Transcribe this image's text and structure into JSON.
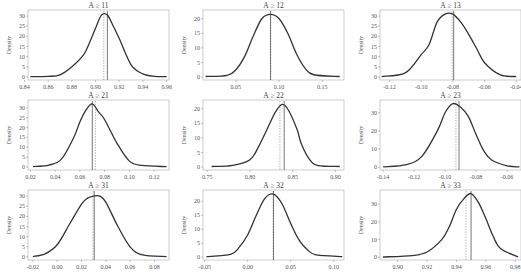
{
  "chart_data": [
    {
      "type": "line",
      "title": "A ≥ 11",
      "ylabel": "Density",
      "xlim": [
        0.843,
        0.962
      ],
      "ylim": [
        -1.5,
        33
      ],
      "xticks": [
        0.84,
        0.86,
        0.88,
        0.9,
        0.92,
        0.94,
        0.96
      ],
      "xtick_labels": [
        "0.84",
        "0.86",
        "0.88",
        "0.90",
        "0.92",
        "0.94",
        "0.96"
      ],
      "yticks": [
        0,
        5,
        10,
        15,
        20,
        25,
        30
      ],
      "ytick_labels": [
        "0",
        "5",
        "10",
        "15",
        "20",
        "25",
        "30"
      ],
      "x": [
        0.845,
        0.86,
        0.87,
        0.88,
        0.89,
        0.895,
        0.9,
        0.905,
        0.91,
        0.915,
        0.92,
        0.93,
        0.94,
        0.95,
        0.96
      ],
      "y": [
        0.2,
        0.3,
        1,
        5,
        11,
        17,
        24,
        30.5,
        30.5,
        25,
        19,
        6,
        1.5,
        0.3,
        0.2
      ],
      "solid_line": 0.91,
      "dashed_line": 0.907
    },
    {
      "type": "line",
      "title": "A ≥ 12",
      "ylabel": "Density",
      "xlim": [
        0.012,
        0.175
      ],
      "ylim": [
        -1,
        23
      ],
      "xticks": [
        0.05,
        0.1,
        0.15
      ],
      "xtick_labels": [
        "0.05",
        "0.10",
        "0.15"
      ],
      "yticks": [
        0,
        5,
        10,
        15,
        20
      ],
      "ytick_labels": [
        "0",
        "5",
        "10",
        "15",
        "20"
      ],
      "x": [
        0.015,
        0.04,
        0.05,
        0.06,
        0.07,
        0.08,
        0.09,
        0.1,
        0.11,
        0.12,
        0.13,
        0.14,
        0.17
      ],
      "y": [
        0.2,
        0.6,
        2.5,
        7,
        14,
        20,
        21.5,
        20,
        15,
        8,
        3,
        0.8,
        0.2
      ],
      "solid_line": 0.09,
      "dashed_line": 0.0905
    },
    {
      "type": "line",
      "title": "A ≥ 13",
      "ylabel": "Density",
      "xlim": [
        -0.126,
        -0.037
      ],
      "ylim": [
        -1.5,
        33
      ],
      "xticks": [
        -0.12,
        -0.1,
        -0.08,
        -0.06,
        -0.04
      ],
      "xtick_labels": [
        "-0.12",
        "-0.10",
        "-0.08",
        "-0.06",
        "-0.04"
      ],
      "yticks": [
        0,
        5,
        10,
        15,
        20,
        25,
        30
      ],
      "ytick_labels": [
        "0",
        "5",
        "10",
        "15",
        "20",
        "25",
        "30"
      ],
      "x": [
        -0.125,
        -0.11,
        -0.1,
        -0.095,
        -0.09,
        -0.085,
        -0.08,
        -0.075,
        -0.07,
        -0.065,
        -0.06,
        -0.05,
        -0.04
      ],
      "y": [
        0.2,
        2,
        11,
        16,
        27,
        31,
        31,
        27,
        21,
        14,
        7,
        1,
        0.2
      ],
      "solid_line": -0.0795,
      "dashed_line": -0.0805
    },
    {
      "type": "line",
      "title": "A ≥ 21",
      "ylabel": "Density",
      "xlim": [
        0.018,
        0.132
      ],
      "ylim": [
        -1.5,
        34
      ],
      "xticks": [
        0.02,
        0.04,
        0.06,
        0.08,
        0.1,
        0.12
      ],
      "xtick_labels": [
        "0.02",
        "0.04",
        "0.06",
        "0.08",
        "0.10",
        "0.12"
      ],
      "yticks": [
        0,
        5,
        10,
        15,
        20,
        25,
        30
      ],
      "ytick_labels": [
        "0",
        "5",
        "10",
        "15",
        "20",
        "25",
        "30"
      ],
      "x": [
        0.022,
        0.035,
        0.045,
        0.055,
        0.06,
        0.065,
        0.07,
        0.075,
        0.08,
        0.09,
        0.1,
        0.11,
        0.13
      ],
      "y": [
        0.2,
        1,
        4,
        15,
        23,
        29,
        32,
        28,
        24,
        12,
        3,
        0.8,
        0.2
      ],
      "solid_line": 0.07,
      "dashed_line": 0.0725
    },
    {
      "type": "line",
      "title": "A ≥ 22",
      "ylabel": "Density",
      "xlim": [
        0.745,
        0.91
      ],
      "ylim": [
        -1,
        23
      ],
      "xticks": [
        0.75,
        0.8,
        0.85,
        0.9
      ],
      "xtick_labels": [
        "0.75",
        "0.80",
        "0.85",
        "0.90"
      ],
      "yticks": [
        0,
        5,
        10,
        15,
        20
      ],
      "ytick_labels": [
        "0",
        "5",
        "10",
        "15",
        "20"
      ],
      "x": [
        0.755,
        0.78,
        0.8,
        0.81,
        0.82,
        0.83,
        0.838,
        0.845,
        0.855,
        0.86,
        0.87,
        0.88,
        0.905
      ],
      "y": [
        0.2,
        0.6,
        2.5,
        7,
        13,
        19,
        21.5,
        19.5,
        13,
        8,
        2.5,
        0.5,
        0.2
      ],
      "solid_line": 0.84,
      "dashed_line": 0.835
    },
    {
      "type": "line",
      "title": "A ≥ 23",
      "ylabel": "Density",
      "xlim": [
        -0.142,
        -0.051
      ],
      "ylim": [
        -1.5,
        37
      ],
      "xticks": [
        -0.14,
        -0.12,
        -0.1,
        -0.08,
        -0.06
      ],
      "xtick_labels": [
        "-0.14",
        "-0.12",
        "-0.10",
        "-0.08",
        "-0.06"
      ],
      "yticks": [
        0,
        10,
        20,
        30
      ],
      "ytick_labels": [
        "0",
        "10",
        "20",
        "30"
      ],
      "x": [
        -0.14,
        -0.125,
        -0.115,
        -0.105,
        -0.1,
        -0.095,
        -0.09,
        -0.085,
        -0.08,
        -0.075,
        -0.07,
        -0.06,
        -0.052
      ],
      "y": [
        0.2,
        1.5,
        6,
        20,
        30,
        35,
        33,
        28,
        18,
        9,
        4,
        0.8,
        0.2
      ],
      "solid_line": -0.091,
      "dashed_line": -0.093
    },
    {
      "type": "line",
      "title": "A ≥ 31",
      "ylabel": "Density",
      "xlim": [
        -0.024,
        0.092
      ],
      "ylim": [
        -1.5,
        33
      ],
      "xticks": [
        -0.02,
        0.0,
        0.02,
        0.04,
        0.06,
        0.08
      ],
      "xtick_labels": [
        "-0.02",
        "0.00",
        "0.02",
        "0.04",
        "0.06",
        "0.08"
      ],
      "yticks": [
        0,
        5,
        10,
        15,
        20,
        25,
        30
      ],
      "ytick_labels": [
        "0",
        "5",
        "10",
        "15",
        "20",
        "25",
        "30"
      ],
      "x": [
        -0.02,
        -0.01,
        0.0,
        0.01,
        0.02,
        0.025,
        0.03,
        0.035,
        0.04,
        0.05,
        0.06,
        0.07,
        0.09
      ],
      "y": [
        0.2,
        1.5,
        6,
        16,
        26,
        29,
        30,
        30,
        27,
        15,
        5,
        1,
        0.2
      ],
      "solid_line": 0.0305,
      "dashed_line": 0.0295
    },
    {
      "type": "line",
      "title": "A ≥ 32",
      "ylabel": "Density",
      "xlim": [
        -0.052,
        0.112
      ],
      "ylim": [
        -1,
        24
      ],
      "xticks": [
        -0.05,
        0.0,
        0.05,
        0.1
      ],
      "xtick_labels": [
        "-0.05",
        "0.00",
        "0.05",
        "0.10"
      ],
      "yticks": [
        0,
        5,
        10,
        15,
        20
      ],
      "ytick_labels": [
        "0",
        "5",
        "10",
        "15",
        "20"
      ],
      "x": [
        -0.048,
        -0.02,
        -0.01,
        0.0,
        0.01,
        0.02,
        0.03,
        0.04,
        0.05,
        0.06,
        0.07,
        0.08,
        0.11
      ],
      "y": [
        0.2,
        1,
        3.5,
        8,
        15,
        21,
        22.5,
        19,
        12,
        6,
        2.5,
        0.8,
        0.2
      ],
      "solid_line": 0.03,
      "dashed_line": 0.0295
    },
    {
      "type": "line",
      "title": "A ≥ 33",
      "ylabel": "Density",
      "xlim": [
        0.888,
        0.984
      ],
      "ylim": [
        -1.5,
        38
      ],
      "xticks": [
        0.9,
        0.92,
        0.94,
        0.96,
        0.98
      ],
      "xtick_labels": [
        "0.90",
        "0.92",
        "0.94",
        "0.96",
        "0.98"
      ],
      "yticks": [
        0,
        10,
        20,
        30
      ],
      "ytick_labels": [
        "0",
        "10",
        "20",
        "30"
      ],
      "x": [
        0.89,
        0.91,
        0.92,
        0.93,
        0.935,
        0.94,
        0.945,
        0.95,
        0.955,
        0.96,
        0.965,
        0.97,
        0.982
      ],
      "y": [
        0.2,
        1,
        3,
        10,
        17,
        27,
        33,
        36,
        31,
        22,
        12,
        5,
        0.2
      ],
      "solid_line": 0.95,
      "dashed_line": 0.9465
    }
  ]
}
